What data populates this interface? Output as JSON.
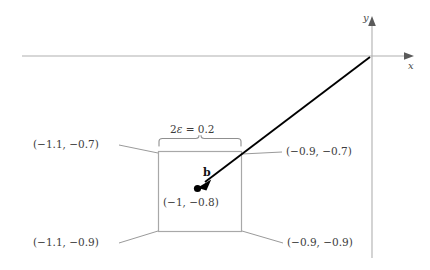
{
  "figure": {
    "type": "geometry-diagram",
    "axes": {
      "x_label": "x",
      "y_label": "y",
      "x_axis_color": "#b0b0b0",
      "y_axis_color": "#b0b0b0"
    },
    "box": {
      "stroke_color": "#a8a8a8",
      "fill": "none",
      "corner_labels": {
        "top_left": "(−1.1, −0.7)",
        "top_right": "(−0.9, −0.7)",
        "bottom_left": "(−1.1, −0.9)",
        "bottom_right": "(−0.9, −0.9)"
      }
    },
    "brace": {
      "label": "2ε = 0.2",
      "label_prefix": "2",
      "label_symbol": "ε",
      "label_suffix": " = 0.2",
      "stroke_color": "#8f8f8f"
    },
    "vector": {
      "label": "b",
      "point_label": "(−1, −0.8)",
      "stroke_color": "#000000",
      "point_color": "#000000"
    },
    "leader_lines": {
      "stroke_color": "#9a9a9a"
    }
  }
}
